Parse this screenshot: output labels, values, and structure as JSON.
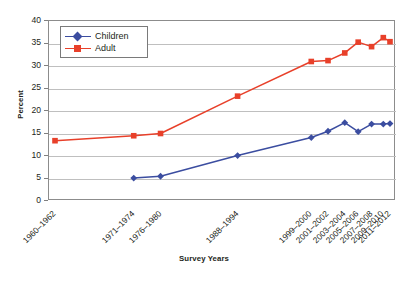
{
  "chart_data": {
    "type": "line",
    "title": "",
    "xlabel": "Survey Years",
    "ylabel": "Percent",
    "ylim": [
      0,
      40
    ],
    "ytick_step": 5,
    "yticks": [
      "40",
      "35",
      "30",
      "25",
      "20",
      "15",
      "10",
      "5",
      "0"
    ],
    "grid": true,
    "legend_position": "top-left inside plot",
    "categories": [
      "1960–1962",
      "1971–1974",
      "1976–1980",
      "1988–1994",
      "1999–2000",
      "2001–2002",
      "2003–2004",
      "2005–2006",
      "2007–2008",
      "2009–2010",
      "2011–2012"
    ],
    "category_positions_pct": [
      0,
      23.5,
      31.5,
      54.5,
      76.5,
      81.5,
      86.5,
      90.5,
      94.5,
      98.0,
      100.0
    ],
    "series": [
      {
        "name": "Children",
        "color": "#3b4da0",
        "marker": "diamond",
        "values": [
          null,
          5.1,
          5.5,
          10.1,
          14.1,
          15.5,
          17.4,
          15.4,
          17.1,
          17.1,
          17.2
        ]
      },
      {
        "name": "Adult",
        "color": "#e8402a",
        "marker": "square",
        "values": [
          13.4,
          14.5,
          15.0,
          23.3,
          31.0,
          31.2,
          32.9,
          35.3,
          34.3,
          36.3,
          35.4
        ]
      }
    ]
  },
  "legend": {
    "items": [
      {
        "label": "Children"
      },
      {
        "label": "Adult"
      }
    ]
  },
  "axes": {
    "y_title": "Percent",
    "x_title": "Survey Years"
  }
}
